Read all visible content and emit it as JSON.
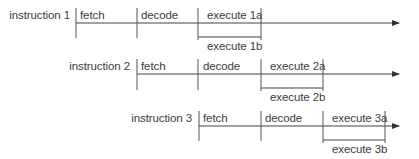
{
  "diagram": {
    "type": "pipeline-timeline",
    "line_color": "#444444",
    "rows": [
      {
        "label": "instruction 1",
        "stages": [
          "fetch",
          "decode",
          "execute 1a"
        ],
        "parallel_stage": "execute 1b"
      },
      {
        "label": "instruction 2",
        "stages": [
          "fetch",
          "decode",
          "execute 2a"
        ],
        "parallel_stage": "execute 2b"
      },
      {
        "label": "instruction 3",
        "stages": [
          "fetch",
          "decode",
          "execute 3a"
        ],
        "parallel_stage": "execute 3b"
      }
    ]
  }
}
